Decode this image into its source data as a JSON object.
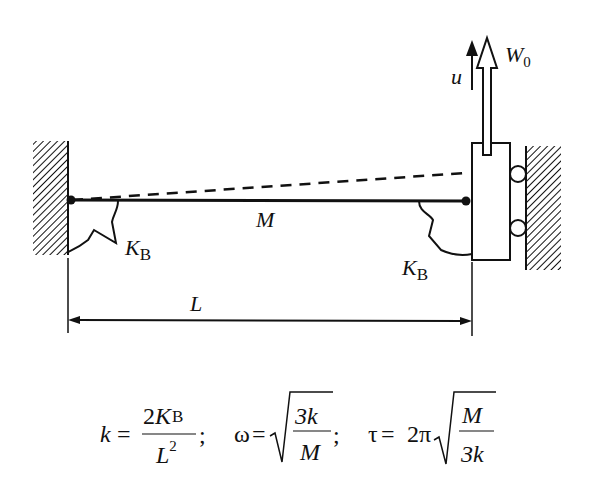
{
  "diagram": {
    "type": "mechanics-schematic",
    "beam": {
      "mass_label": "M"
    },
    "springs": {
      "left": {
        "label_main": "K",
        "label_sub": "B"
      },
      "right": {
        "label_main": "K",
        "label_sub": "B"
      }
    },
    "load": {
      "label_main": "W",
      "label_sub": "0"
    },
    "displacement": {
      "label": "u"
    },
    "dimension": {
      "label": "L"
    }
  },
  "formulas": {
    "k": {
      "lhs": "k",
      "eq": "=",
      "num_coef": "2",
      "num_var": "K",
      "num_sub": "B",
      "den_var": "L",
      "den_sup": "2",
      "sep": ";"
    },
    "omega": {
      "lhs": "ω",
      "eq": "=",
      "num": "3k",
      "den": "M",
      "sep": ";"
    },
    "tau": {
      "lhs": "τ",
      "eq": "=",
      "coef": "2π",
      "num": "M",
      "den": "3k"
    }
  },
  "colors": {
    "ink": "#111111",
    "background": "#ffffff"
  }
}
